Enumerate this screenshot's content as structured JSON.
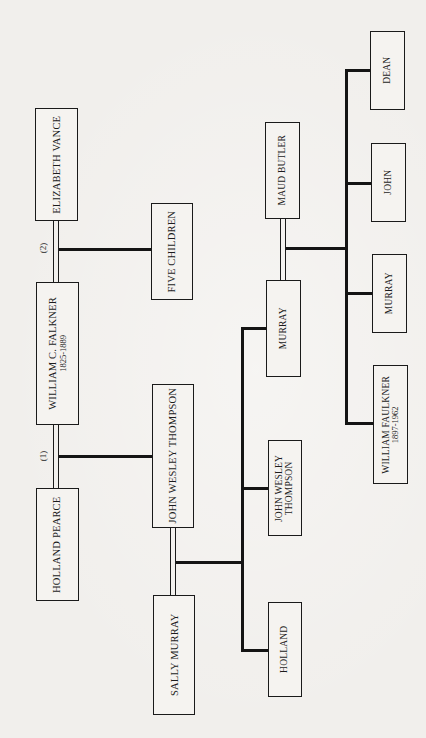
{
  "diagram": {
    "type": "family-tree",
    "orientation": "rotated-90-ccw",
    "generations": [
      {
        "level": 1,
        "people": [
          {
            "id": "holland_pearce",
            "name": "HOLLAND PEARCE"
          },
          {
            "id": "william_c_falkner",
            "name": "WILLIAM C. FALKNER",
            "dates": "1825-1889"
          },
          {
            "id": "elizabeth_vance",
            "name": "ELIZABETH VANCE"
          }
        ],
        "marriage_labels": [
          {
            "label": "(1)",
            "between": [
              "william_c_falkner",
              "holland_pearce"
            ]
          },
          {
            "label": "(2)",
            "between": [
              "william_c_falkner",
              "elizabeth_vance"
            ]
          }
        ]
      },
      {
        "level": 2,
        "people": [
          {
            "id": "sally_murray",
            "name": "SALLY MURRAY"
          },
          {
            "id": "john_wesley_thompson_1",
            "name": "JOHN WESLEY THOMPSON",
            "parent_marriage": "(1)"
          },
          {
            "id": "five_children",
            "name": "FIVE CHILDREN",
            "parent_marriage": "(2)"
          }
        ]
      },
      {
        "level": 3,
        "people": [
          {
            "id": "holland",
            "name": "HOLLAND"
          },
          {
            "id": "john_wesley_thompson_2",
            "name": "JOHN WESLEY THOMPSON",
            "name_lines": [
              "JOHN WESLEY",
              "THOMPSON"
            ]
          },
          {
            "id": "murray",
            "name": "MURRAY"
          },
          {
            "id": "maud_butler",
            "name": "MAUD BUTLER"
          }
        ]
      },
      {
        "level": 4,
        "people": [
          {
            "id": "william_faulkner",
            "name": "WILLIAM FAULKNER",
            "dates": "1897-1962"
          },
          {
            "id": "murray_jr",
            "name": "MURRAY"
          },
          {
            "id": "john",
            "name": "JOHN"
          },
          {
            "id": "dean",
            "name": "DEAN"
          }
        ]
      }
    ]
  },
  "labels": {
    "elizabeth_vance": "ELIZABETH VANCE",
    "william_c_falkner": "WILLIAM C. FALKNER",
    "william_c_falkner_dates": "1825-1889",
    "holland_pearce": "HOLLAND PEARCE",
    "marriage_2": "(2)",
    "marriage_1": "(1)",
    "five_children": "FIVE CHILDREN",
    "john_wesley_thompson": "JOHN WESLEY THOMPSON",
    "sally_murray": "SALLY MURRAY",
    "maud_butler": "MAUD BUTLER",
    "murray": "MURRAY",
    "jwt_line1": "JOHN WESLEY",
    "jwt_line2": "THOMPSON",
    "holland": "HOLLAND",
    "dean": "DEAN",
    "john": "JOHN",
    "murray_child": "MURRAY",
    "william_faulkner": "WILLIAM FAULKNER",
    "william_faulkner_dates": "1897-1962"
  }
}
